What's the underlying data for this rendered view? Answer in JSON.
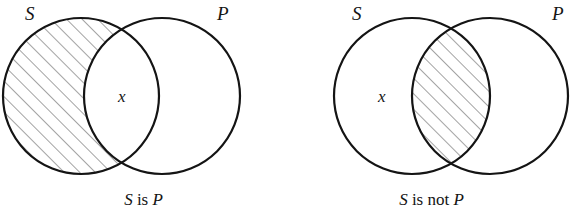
{
  "figure": {
    "type": "venn-diagram-pair",
    "background_color": "#ffffff",
    "stroke_color": "#141414",
    "hatch_color": "#555555",
    "hatch_direction": "diagonal-up-right",
    "panels": [
      {
        "id": "left",
        "caption": "S is P",
        "caption_parts": {
          "subject": "S",
          "copula": "is",
          "predicate": "P"
        },
        "left_circle": {
          "label": "S",
          "cx": 81,
          "cy": 96,
          "r": 78
        },
        "right_circle": {
          "label": "P",
          "cx": 162,
          "cy": 96,
          "r": 78
        },
        "shaded_region": "S-only",
        "shaded_region_description": "the part of S outside P is shaded",
        "member_marker": {
          "text": "x",
          "region": "intersection",
          "x": 118,
          "y": 88
        },
        "label_positions": {
          "left": {
            "x": 25,
            "y": 4
          },
          "right": {
            "x": 217,
            "y": 4
          }
        }
      },
      {
        "id": "right",
        "caption": "S is not P",
        "caption_parts": {
          "subject": "S",
          "copula": "is not",
          "predicate": "P"
        },
        "left_circle": {
          "label": "S",
          "cx": 124,
          "cy": 96,
          "r": 78
        },
        "right_circle": {
          "label": "P",
          "cx": 202,
          "cy": 96,
          "r": 78
        },
        "shaded_region": "intersection",
        "shaded_region_description": "the overlap of S and P is shaded",
        "member_marker": {
          "text": "x",
          "region": "S-only",
          "x": 90,
          "y": 88
        },
        "label_positions": {
          "left": {
            "x": 64,
            "y": 4
          },
          "right": {
            "x": 264,
            "y": 4
          }
        }
      }
    ]
  }
}
